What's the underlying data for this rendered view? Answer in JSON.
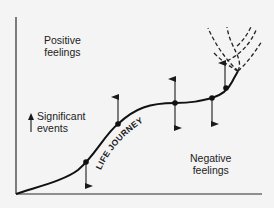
{
  "diagram": {
    "type": "life-journey-curve",
    "labels": {
      "positive_line1": "Positive",
      "positive_line2": "feelings",
      "negative_line1": "Negative",
      "negative_line2": "feelings",
      "significant_line1": "Significant",
      "significant_line2": "events",
      "curve_label": "LIFE JOURNEY"
    },
    "colors": {
      "background": "#f4f4f4",
      "ink": "#1a1a1a"
    },
    "event_points": [
      {
        "x": 86,
        "y": 162,
        "arrows": [
          "down"
        ]
      },
      {
        "x": 118,
        "y": 124,
        "arrows": [
          "up"
        ]
      },
      {
        "x": 175,
        "y": 103,
        "arrows": [
          "up",
          "down"
        ]
      },
      {
        "x": 212,
        "y": 98,
        "arrows": [
          "down"
        ]
      },
      {
        "x": 225,
        "y": 88,
        "arrows": [
          "up"
        ]
      }
    ],
    "future_branches": 3
  }
}
